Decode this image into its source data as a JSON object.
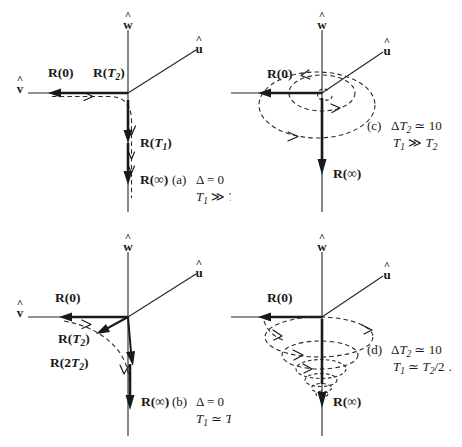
{
  "figure": {
    "type": "vector-trajectory-diagram",
    "background_color": "#ffffff",
    "ink_color": "#1a1a1a",
    "panel_count": 4
  },
  "axes": {
    "w_label": "w",
    "u_label": "u",
    "v_label": "v",
    "hat_glyph": "^"
  },
  "panels": {
    "a": {
      "id": "a",
      "caption_tag": "(a)",
      "caption_line1": "Δ = 0",
      "caption_line2_lead": "T",
      "caption_line2_sub": "1",
      "caption_line2_rel": " ≫ ",
      "caption_line2_tail": "T",
      "caption_line2_tail_sub": "2",
      "vec_initial": "R(0)",
      "vec_t2_lead": "R(",
      "vec_t2_ital": "T",
      "vec_t2_sub": "2",
      "vec_t2_tail": ")",
      "vec_t1_lead": "R(",
      "vec_t1_ital": "T",
      "vec_t1_sub": "1",
      "vec_t1_tail": ")",
      "vec_final": "R(∞)",
      "trajectory": "overdamped-elbow",
      "description": "Vector relaxes along -v then bends down to -w with no precession"
    },
    "b": {
      "id": "b",
      "caption_tag": "(b)",
      "caption_line1": "Δ = 0",
      "caption_line2_lead": "T",
      "caption_line2_sub": "1",
      "caption_line2_rel": " ≃ ",
      "caption_line2_tail": "T",
      "caption_line2_tail_sub": "2",
      "caption_line2_div": "/2",
      "vec_initial": "R(0)",
      "vec_t2_lead": "R(",
      "vec_t2_ital": "T",
      "vec_t2_sub": "2",
      "vec_t2_tail": ")",
      "vec_2t2_lead": "R(2",
      "vec_2t2_ital": "T",
      "vec_2t2_sub": "2",
      "vec_2t2_tail": ")",
      "vec_final": "R(∞)",
      "trajectory": "damped-arc",
      "description": "Vector sweeps in an arc through intermediate states to -w"
    },
    "c": {
      "id": "c",
      "caption_tag": "(c)",
      "caption_line1_lead": "Δ",
      "caption_line1_ital": "T",
      "caption_line1_sub": "2",
      "caption_line1_tail": " ≃ 10",
      "caption_line2_lead": "T",
      "caption_line2_sub": "1",
      "caption_line2_rel": " ≫ ",
      "caption_line2_tail": "T",
      "caption_line2_tail_sub": "2",
      "vec_initial": "R(0)",
      "vec_final": "R(∞)",
      "trajectory": "precessing-ellipses",
      "description": "Off-resonance precession: two concentric dashed ellipses about w"
    },
    "d": {
      "id": "d",
      "caption_tag": "(d)",
      "caption_line1_lead": "Δ",
      "caption_line1_ital": "T",
      "caption_line1_sub": "2",
      "caption_line1_tail": " ≃ 10",
      "caption_line2_lead": "T",
      "caption_line2_sub": "1",
      "caption_line2_rel": " ≃ ",
      "caption_line2_tail": "T",
      "caption_line2_tail_sub": "2",
      "caption_line2_div": "/2",
      "caption_period": ".",
      "vec_initial": "R(0)",
      "vec_final": "R(∞)",
      "trajectory": "converging-conical-spiral",
      "description": "Off-resonance precession spiralling down a cone toward -w"
    }
  }
}
